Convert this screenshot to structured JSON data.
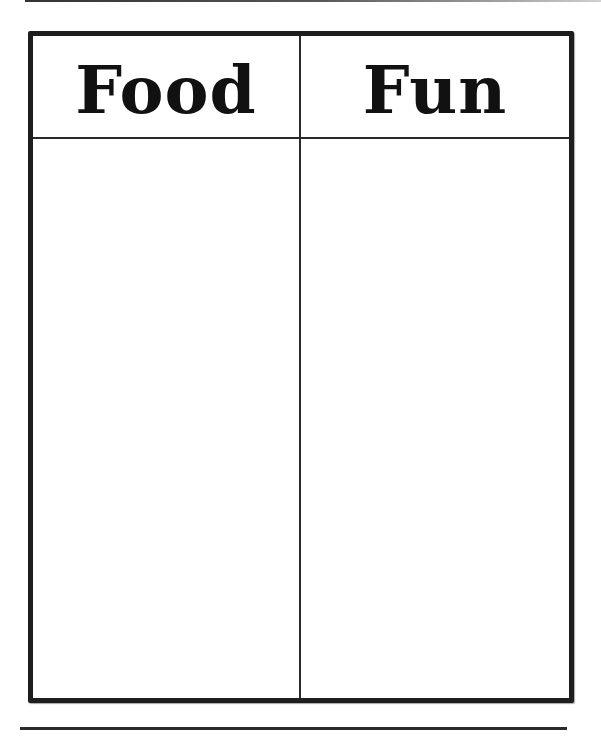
{
  "worksheet": {
    "type": "t-chart",
    "columns": [
      {
        "header": "Food",
        "entries": []
      },
      {
        "header": "Fun",
        "entries": []
      }
    ]
  },
  "colors": {
    "border": "#1e1e1e",
    "text": "#111111",
    "background": "#ffffff"
  }
}
